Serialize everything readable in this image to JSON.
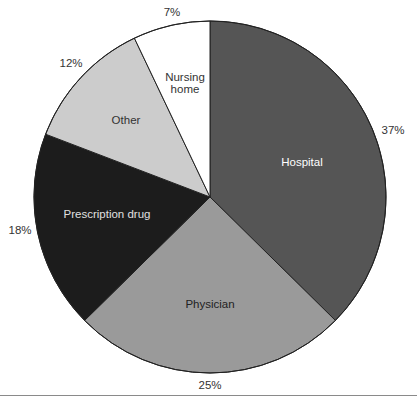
{
  "chart_data": {
    "type": "pie",
    "title": "",
    "start_angle_deg": 0,
    "direction": "clockwise",
    "slices": [
      {
        "label": "Hospital",
        "value": 37,
        "pct_label": "37%",
        "color": "#555555",
        "text_color": "#ffffff",
        "label_pos": [
          302,
          163
        ],
        "pct_pos": [
          393,
          131
        ]
      },
      {
        "label": "Physician",
        "value": 25,
        "pct_label": "25%",
        "color": "#9a9a9a",
        "text_color": "#222222",
        "label_pos": [
          210,
          305
        ],
        "pct_pos": [
          210,
          386
        ]
      },
      {
        "label": "Prescription drug",
        "value": 18,
        "pct_label": "18%",
        "color": "#1c1c1c",
        "text_color": "#e0e0e0",
        "label_pos": [
          107,
          215
        ],
        "pct_pos": [
          20,
          231
        ]
      },
      {
        "label": "Other",
        "value": 12,
        "pct_label": "12%",
        "color": "#cccccc",
        "text_color": "#333333",
        "label_pos": [
          126,
          121
        ],
        "pct_pos": [
          71,
          64
        ]
      },
      {
        "label": "Nursing home",
        "label_lines": [
          "Nursing",
          "home"
        ],
        "value": 7,
        "pct_label": "7%",
        "color": "#ffffff",
        "text_color": "#333333",
        "label_pos": [
          185,
          84
        ],
        "pct_pos": [
          172,
          13
        ]
      }
    ],
    "center": [
      210,
      197
    ],
    "radius": 176,
    "stroke_color": "#222222",
    "legend": "none"
  }
}
